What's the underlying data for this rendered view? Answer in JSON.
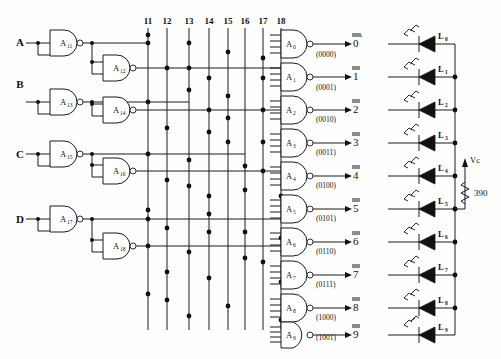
{
  "diagram": {
    "inputs": [
      {
        "label": "A",
        "y": 43
      },
      {
        "label": "B",
        "y": 84
      },
      {
        "label": "C",
        "y": 154
      },
      {
        "label": "D",
        "y": 219
      }
    ],
    "input_gates": [
      {
        "label": "A",
        "sub": "11",
        "x": 50,
        "y": 30
      },
      {
        "label": "A",
        "sub": "12",
        "x": 103,
        "y": 55
      },
      {
        "label": "A",
        "sub": "13",
        "x": 50,
        "y": 89
      },
      {
        "label": "A",
        "sub": "14",
        "x": 103,
        "y": 97
      },
      {
        "label": "A",
        "sub": "15",
        "x": 50,
        "y": 144
      },
      {
        "label": "A",
        "sub": "16",
        "x": 103,
        "y": 158
      },
      {
        "label": "A",
        "sub": "17",
        "x": 50,
        "y": 206
      },
      {
        "label": "A",
        "sub": "18",
        "x": 103,
        "y": 233
      }
    ],
    "columns": [
      {
        "label": "11",
        "x": 148
      },
      {
        "label": "12",
        "x": 167
      },
      {
        "label": "13",
        "x": 189
      },
      {
        "label": "14",
        "x": 209
      },
      {
        "label": "15",
        "x": 228
      },
      {
        "label": "16",
        "x": 245
      },
      {
        "label": "17",
        "x": 263
      },
      {
        "label": "18",
        "x": 281
      }
    ],
    "output_rows": [
      {
        "gate": "A",
        "sub": "0",
        "code": "(0000)",
        "out": "0",
        "led": "L",
        "ledsub": "0"
      },
      {
        "gate": "A",
        "sub": "1",
        "code": "(0001)",
        "out": "1",
        "led": "L",
        "ledsub": "1"
      },
      {
        "gate": "A",
        "sub": "2",
        "code": "(0010)",
        "out": "2",
        "led": "L",
        "ledsub": "2"
      },
      {
        "gate": "A",
        "sub": "3",
        "code": "(0011)",
        "out": "3",
        "led": "L",
        "ledsub": "3"
      },
      {
        "gate": "A",
        "sub": "4",
        "code": "(0100)",
        "out": "4",
        "led": "L",
        "ledsub": "4"
      },
      {
        "gate": "A",
        "sub": "5",
        "code": "(0101)",
        "out": "5",
        "led": "L",
        "ledsub": "5"
      },
      {
        "gate": "A",
        "sub": "6",
        "code": "(0110)",
        "out": "6",
        "led": "L",
        "ledsub": "6"
      },
      {
        "gate": "A",
        "sub": "7",
        "code": "(0111)",
        "out": "7",
        "led": "L",
        "ledsub": "7"
      },
      {
        "gate": "A",
        "sub": "8",
        "code": "(1000)",
        "out": "8",
        "led": "L",
        "ledsub": "8"
      },
      {
        "gate": "A",
        "sub": "9",
        "code": "(1001)",
        "out": "9",
        "led": "L",
        "ledsub": "9"
      }
    ],
    "supply": {
      "label": "Vc",
      "resistor_value": "390"
    },
    "colors": {
      "ink": "#1a1a1a",
      "paper": "#fefefe"
    }
  }
}
